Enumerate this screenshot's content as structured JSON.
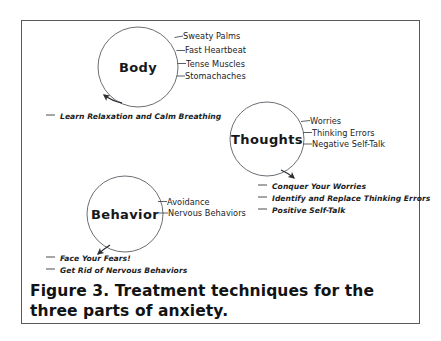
{
  "figure": {
    "caption": "Figure 3. Treatment techniques for the three parts of anxiety.",
    "border_color": "#555a5e",
    "text_color": "#1b1d1f",
    "background": "#ffffff"
  },
  "nodes": [
    {
      "id": "body",
      "title": "Body",
      "symptoms": [
        {
          "label": "Sweaty Palms"
        },
        {
          "label": "Fast Heartbeat"
        },
        {
          "label": "Tense Muscles"
        },
        {
          "label": "Stomachaches"
        }
      ],
      "techniques": [
        {
          "label": "Learn Relaxation and Calm Breathing"
        }
      ]
    },
    {
      "id": "thoughts",
      "title": "Thoughts",
      "symptoms": [
        {
          "label": "Worries"
        },
        {
          "label": "Thinking Errors"
        },
        {
          "label": "Negative Self-Talk"
        }
      ],
      "techniques": [
        {
          "label": "Conquer Your Worries"
        },
        {
          "label": "Identify and Replace Thinking Errors"
        },
        {
          "label": "Positive Self-Talk"
        }
      ]
    },
    {
      "id": "behavior",
      "title": "Behavior",
      "symptoms": [
        {
          "label": "Avoidance"
        },
        {
          "label": "Nervous Behaviors"
        }
      ],
      "techniques": [
        {
          "label": "Face Your Fears!"
        },
        {
          "label": "Get Rid of Nervous Behaviors"
        }
      ]
    }
  ]
}
